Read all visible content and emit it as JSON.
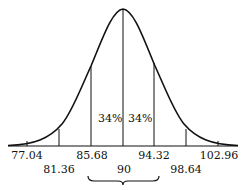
{
  "diagram": {
    "type": "normal-distribution-curve",
    "mean": "90",
    "ticks_upper_row": [
      "77.04",
      "85.68",
      "94.32",
      "102.96"
    ],
    "ticks_lower_row": [
      "81.36",
      "90",
      "98.64"
    ],
    "region_labels": {
      "left_of_mean": "34%",
      "right_of_mean": "34%"
    },
    "stroke_color": "#111111",
    "background": "#ffffff"
  },
  "labels": {
    "t77": "77.04",
    "t81": "81.36",
    "t85": "85.68",
    "t90": "90",
    "t94": "94.32",
    "t98": "98.64",
    "t102": "102.96",
    "pct_left": "34%",
    "pct_right": "34%"
  }
}
